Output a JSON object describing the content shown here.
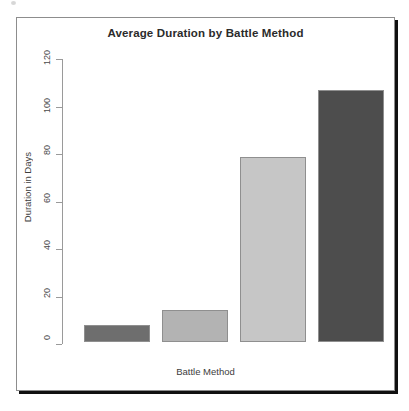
{
  "figure": {
    "title": "Average Duration by Battle Method",
    "xlabel": "Battle Method",
    "ylabel": "Duration in Days"
  },
  "chart_data": {
    "type": "bar",
    "title": "Average Duration by Battle Method",
    "xlabel": "Battle Method",
    "ylabel": "Duration in Days",
    "categories": [
      "",
      "",
      "",
      ""
    ],
    "values": [
      7,
      13.5,
      78,
      106
    ],
    "colors": [
      "#6e6e6e",
      "#b3b3b3",
      "#c6c6c6",
      "#4d4d4d"
    ],
    "ylim": [
      0,
      120
    ],
    "yticks": [
      0,
      20,
      40,
      60,
      80,
      100,
      120
    ],
    "ytick_labels": [
      "0",
      "20",
      "40",
      "60",
      "80",
      "100",
      "120"
    ],
    "grid": false,
    "legend": false
  }
}
